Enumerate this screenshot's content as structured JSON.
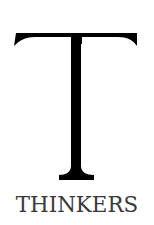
{
  "logo": {
    "monogram": "T",
    "wordmark": "THINKERS",
    "colors": {
      "background": "#ffffff",
      "monogram": "#000000",
      "wordmark": "#3a3a3a"
    }
  }
}
